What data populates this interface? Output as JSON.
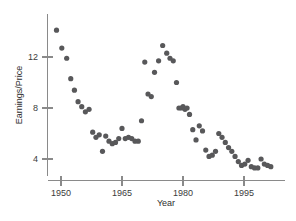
{
  "chart_data": {
    "type": "scatter",
    "title": "",
    "xlabel": "Year",
    "ylabel": "Earnings/Price",
    "xlim": [
      1947.5,
      2002.5
    ],
    "ylim": [
      2.2,
      14.6
    ],
    "xticks": [
      1950,
      1965,
      1980,
      1995
    ],
    "xticklabels": [
      "1950",
      "1965",
      "1980",
      "1995"
    ],
    "yticks": [
      4,
      8,
      12
    ],
    "yticklabels": [
      "4",
      "8",
      "12"
    ],
    "grid": false,
    "legend": null,
    "marker": {
      "shape": "circle",
      "color": "#58585a",
      "size": 2.6
    },
    "x": [
      1948.9,
      1950.2,
      1951.4,
      1952.4,
      1953.3,
      1954.2,
      1955.1,
      1956.0,
      1956.9,
      1957.8,
      1958.6,
      1959.4,
      1960.2,
      1961.0,
      1961.8,
      1962.6,
      1963.4,
      1964.2,
      1965.0,
      1965.8,
      1966.6,
      1967.4,
      1968.2,
      1969.0,
      1969.8,
      1970.6,
      1971.4,
      1972.2,
      1973.0,
      1974.0,
      1975.0,
      1976.0,
      1976.8,
      1977.6,
      1978.4,
      1979.0,
      1979.6,
      1980.0,
      1980.5,
      1981.0,
      1981.6,
      1982.4,
      1983.2,
      1984.0,
      1984.8,
      1985.6,
      1986.4,
      1987.2,
      1988.0,
      1988.8,
      1989.6,
      1990.4,
      1991.2,
      1992.0,
      1992.8,
      1993.6,
      1994.4,
      1995.2,
      1996.0,
      1996.8,
      1997.6,
      1998.4,
      1999.2,
      2000.0,
      2000.8,
      2001.6
    ],
    "y": [
      14.1,
      12.7,
      11.9,
      10.3,
      9.4,
      8.5,
      8.1,
      7.7,
      7.9,
      6.1,
      5.7,
      5.9,
      4.6,
      5.8,
      5.4,
      5.2,
      5.3,
      5.6,
      6.4,
      5.6,
      5.7,
      5.6,
      5.4,
      5.4,
      7.0,
      11.6,
      9.1,
      8.9,
      10.8,
      11.7,
      12.9,
      12.3,
      11.9,
      11.7,
      10.0,
      8.0,
      8.0,
      8.1,
      7.9,
      8.0,
      7.5,
      6.3,
      5.5,
      6.6,
      6.2,
      4.7,
      4.2,
      4.3,
      4.6,
      6.0,
      5.7,
      5.3,
      4.9,
      4.6,
      4.2,
      3.8,
      3.5,
      3.6,
      3.9,
      3.4,
      3.3,
      3.3,
      4.0,
      3.6,
      3.5,
      3.4
    ]
  },
  "axes": {
    "y_label": "Earnings/Price",
    "x_label": "Year"
  }
}
